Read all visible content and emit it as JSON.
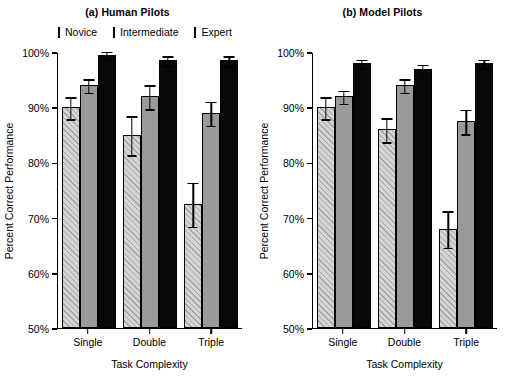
{
  "chart_data": {
    "type": "bar",
    "title": "",
    "panels": [
      {
        "title": "(a) Human Pilots",
        "xlabel": "Task Complexity",
        "ylabel": "Percent Correct Performance",
        "categories": [
          "Single",
          "Double",
          "Triple"
        ],
        "ylim": [
          50,
          100
        ],
        "ytick_labels": [
          "50%",
          "60%",
          "70%",
          "80%",
          "90%",
          "100%"
        ],
        "ytick_values": [
          50,
          60,
          70,
          80,
          90,
          100
        ],
        "grid": false,
        "legend_position": "top",
        "series": [
          {
            "name": "Novice",
            "values": [
              90.0,
              85.0,
              72.5
            ],
            "errors": [
              2.0,
              3.5,
              4.0
            ]
          },
          {
            "name": "Intermediate",
            "values": [
              94.0,
              92.0,
              89.0
            ],
            "errors": [
              1.2,
              2.2,
              2.2
            ]
          },
          {
            "name": "Expert",
            "values": [
              99.5,
              98.5,
              98.5
            ],
            "errors": [
              0.7,
              0.9,
              0.9
            ]
          }
        ]
      },
      {
        "title": "(b) Model Pilots",
        "xlabel": "Task Complexity",
        "ylabel": "Percent Correct Performance",
        "categories": [
          "Single",
          "Double",
          "Triple"
        ],
        "ylim": [
          50,
          100
        ],
        "ytick_labels": [
          "50%",
          "60%",
          "70%",
          "80%",
          "90%",
          "100%"
        ],
        "ytick_values": [
          50,
          60,
          70,
          80,
          90,
          100
        ],
        "grid": false,
        "legend_position": "top",
        "series": [
          {
            "name": "Novice",
            "values": [
              90.0,
              86.0,
              68.0
            ],
            "errors": [
              2.0,
              2.2,
              3.3
            ]
          },
          {
            "name": "Intermediate",
            "values": [
              92.0,
              94.0,
              87.5
            ],
            "errors": [
              1.2,
              1.2,
              2.2
            ]
          },
          {
            "name": "Expert",
            "values": [
              98.0,
              97.0,
              98.0
            ],
            "errors": [
              0.8,
              0.9,
              0.8
            ]
          }
        ]
      }
    ],
    "legend": [
      {
        "label": "Novice",
        "color": "#d4d4d4",
        "pattern": "diagonal-hatch"
      },
      {
        "label": "Intermediate",
        "color": "#9a9a9a",
        "pattern": "solid"
      },
      {
        "label": "Expert",
        "color": "#080808",
        "pattern": "solid"
      }
    ]
  }
}
